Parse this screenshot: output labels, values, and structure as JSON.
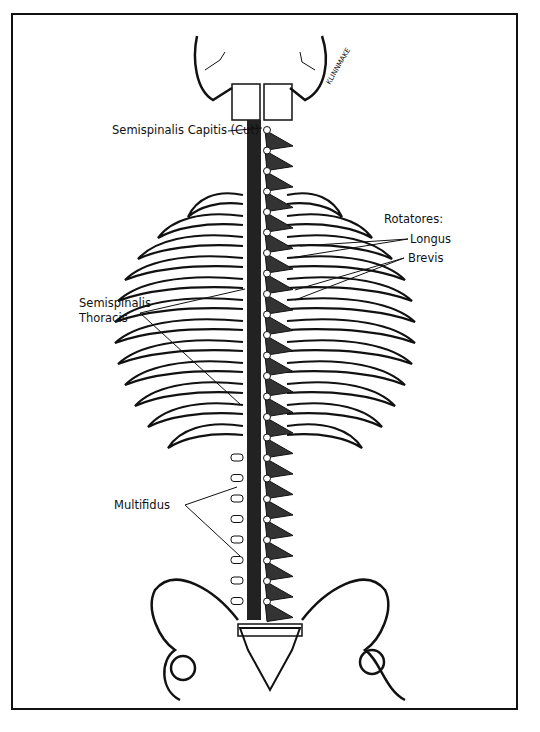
{
  "figure": {
    "type": "anatomical illustration",
    "signature": "KLINNMAKE"
  },
  "labels": {
    "semispinalis_capitis": "Semispinalis Capitis (Cut)",
    "rotatores_heading": "Rotatores:",
    "longus": "Longus",
    "brevis": "Brevis",
    "semispinalis_thoracis_line1": "Semispinalis",
    "semispinalis_thoracis_line2": "Thoracis",
    "multifidus": "Multifidus"
  },
  "colors": {
    "ink": "#111111",
    "paper": "#ffffff"
  }
}
